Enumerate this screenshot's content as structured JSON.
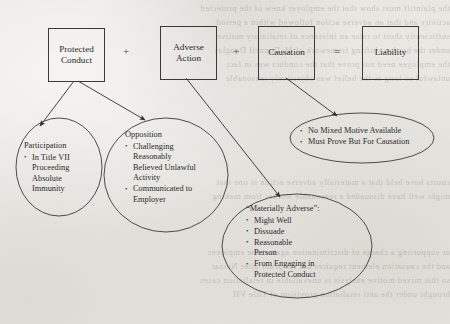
{
  "page": {
    "background_color": "#e9e7e2",
    "ink_color": "#2b2b2b",
    "showthrough_lines": [
      "the plaintiff must show that the employer knew of the protected",
      "activity and that an adverse action followed within a period",
      "sufficiently short to raise an inference of retaliatory motive",
      "under the burden shifting framework of McDonnell Douglas",
      "the employee need not prove that the conduct was in fact",
      "unlawful so long as the belief was objectively reasonable",
      "courts have held that a materially adverse action is one that",
      "might well have dissuaded a reasonable worker from making",
      "or supporting a charge of discrimination against the employer",
      "and the causation element requires but for proof after Nassar",
      "so that mixed motive analysis is unavailable in retaliation cases",
      "brought under the anti retaliation provision of Title VII"
    ]
  },
  "diagram": {
    "type": "flow-equation",
    "boxes": [
      {
        "id": "protected-conduct",
        "label": "Protected\nConduct",
        "line1": "Protected",
        "line2": "Conduct"
      },
      {
        "id": "adverse-action",
        "label": "Adverse\nAction",
        "line1": "Adverse",
        "line2": "Action"
      },
      {
        "id": "causation",
        "label": "Causation",
        "line1": "Causation",
        "line2": ""
      },
      {
        "id": "liability",
        "label": "Liability",
        "line1": "Liability",
        "line2": ""
      }
    ],
    "operators": [
      {
        "id": "plus-1",
        "symbol": "+"
      },
      {
        "id": "plus-2",
        "symbol": "+"
      },
      {
        "id": "equals",
        "symbol": "="
      }
    ],
    "bubbles": [
      {
        "id": "participation",
        "title": "Participation",
        "items": [
          {
            "text": "In Title VII",
            "continuations": [
              "Proceeding",
              "Absolute",
              "Immunity"
            ]
          }
        ]
      },
      {
        "id": "opposition",
        "title": "Opposition",
        "items": [
          {
            "text": "Challenging",
            "continuations": [
              "Reasonably",
              "Believed Unlawful",
              "Activity"
            ]
          },
          {
            "text": "Communicated to",
            "continuations": [
              "Employer"
            ]
          }
        ]
      },
      {
        "id": "causation-detail",
        "title": "",
        "items": [
          {
            "text": "No Mixed Motive Available",
            "continuations": []
          },
          {
            "text": "Must Prove But For Causation",
            "continuations": []
          }
        ]
      },
      {
        "id": "materially-adverse",
        "title": "“Materially Adverse”:",
        "items": [
          {
            "text": "Might Well",
            "continuations": []
          },
          {
            "text": "Dissuade",
            "continuations": []
          },
          {
            "text": "Reasonable",
            "continuations": [
              "Person"
            ]
          },
          {
            "text": "From Engaging in",
            "continuations": [
              "Protected Conduct"
            ]
          }
        ]
      }
    ],
    "arrows": [
      {
        "id": "arrow-protected-to-participation",
        "from": "protected-conduct",
        "to": "participation"
      },
      {
        "id": "arrow-protected-to-opposition",
        "from": "protected-conduct",
        "to": "opposition"
      },
      {
        "id": "arrow-adverse-to-materially",
        "from": "adverse-action",
        "to": "materially-adverse"
      },
      {
        "id": "arrow-causation-to-detail",
        "from": "causation",
        "to": "causation-detail"
      }
    ]
  }
}
